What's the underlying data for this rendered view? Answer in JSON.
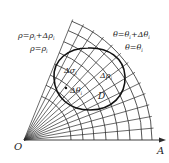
{
  "diagram": {
    "type": "polar-coordinate-grid",
    "origin_label": "O",
    "axis_label": "A",
    "region_label": "D",
    "labels": {
      "rho_outer": "ρ=ρ",
      "rho_outer_sub": "i",
      "rho_outer_plus": "+Δρ",
      "rho_outer_plus_sub": "i",
      "rho_inner": "ρ=ρ",
      "rho_inner_sub": "i",
      "theta_outer": "θ=θ",
      "theta_outer_sub": "i",
      "theta_outer_plus": "+Δθ",
      "theta_outer_plus_sub": "i",
      "theta_inner": "θ=θ",
      "theta_inner_sub": "i",
      "delta_sigma": "Δσ",
      "delta_sigma_sub": "i",
      "delta_rho": "Δρ",
      "delta_rho_sub": "i",
      "delta_theta": "Δθ",
      "delta_theta_sub": "i"
    },
    "colors": {
      "line": "#2a2a2a",
      "region_boundary": "#111111",
      "background": "#ffffff"
    }
  }
}
